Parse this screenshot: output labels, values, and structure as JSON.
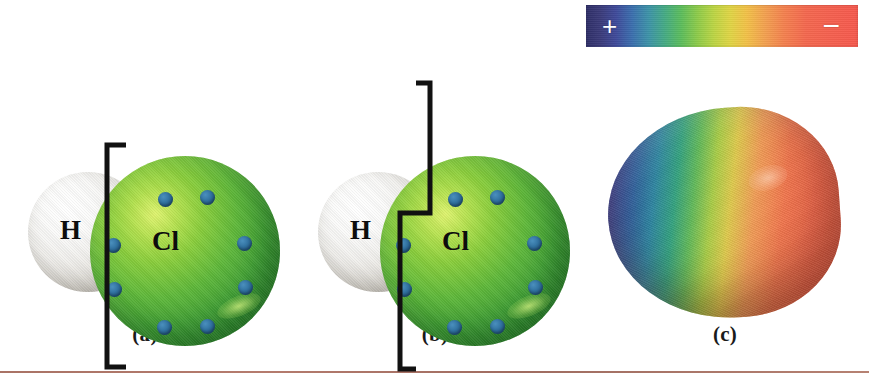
{
  "figure": {
    "width": 869,
    "height": 385
  },
  "scale_bar": {
    "name": "electrostatic-potential-scale",
    "positive_label": "+",
    "negative_label": "−",
    "stops": [
      {
        "pos": 0,
        "color": "#2f2f68",
        "name": "dark-blue"
      },
      {
        "pos": 11,
        "color": "#3f4a9a",
        "name": "blue"
      },
      {
        "pos": 23,
        "color": "#3d93a8",
        "name": "cyan"
      },
      {
        "pos": 35,
        "color": "#5cbd5c",
        "name": "green"
      },
      {
        "pos": 53,
        "color": "#e0d545",
        "name": "yellow"
      },
      {
        "pos": 72,
        "color": "#f4804f",
        "name": "orange"
      },
      {
        "pos": 100,
        "color": "#f6594e",
        "name": "red"
      }
    ]
  },
  "panels": [
    {
      "id": "a",
      "caption": "(a)",
      "atoms": [
        {
          "symbol": "H",
          "name": "hydrogen-atom",
          "color": "#e8e6e1"
        },
        {
          "symbol": "Cl",
          "name": "chlorine-atom",
          "color": "#4fae3c"
        }
      ],
      "lone_pair_dots": 8,
      "dot_color": "#2f6f9d",
      "bracket": {
        "name": "straight-bracket",
        "type": "straight"
      }
    },
    {
      "id": "b",
      "caption": "(b)",
      "atoms": [
        {
          "symbol": "H",
          "name": "hydrogen-atom",
          "color": "#e8e6e1"
        },
        {
          "symbol": "Cl",
          "name": "chlorine-atom",
          "color": "#4fae3c"
        }
      ],
      "lone_pair_dots": 8,
      "dot_color": "#2f6f9d",
      "bracket": {
        "name": "stepped-bracket",
        "type": "stepped"
      }
    },
    {
      "id": "c",
      "caption": "(c)",
      "surface": {
        "name": "electrostatic-potential-surface",
        "shape": "teardrop",
        "positive_end": "blue",
        "negative_end": "red"
      }
    }
  ],
  "dot_positions_a": [
    {
      "left": 68,
      "top": 36
    },
    {
      "left": 110,
      "top": 34
    },
    {
      "left": 16,
      "top": 82
    },
    {
      "left": 17,
      "top": 126
    },
    {
      "left": 147,
      "top": 80
    },
    {
      "left": 148,
      "top": 124
    },
    {
      "left": 67,
      "top": 164
    },
    {
      "left": 110,
      "top": 163
    }
  ],
  "dot_positions_b": [
    {
      "left": 68,
      "top": 36
    },
    {
      "left": 110,
      "top": 34
    },
    {
      "left": 16,
      "top": 82
    },
    {
      "left": 17,
      "top": 126
    },
    {
      "left": 147,
      "top": 80
    },
    {
      "left": 148,
      "top": 124
    },
    {
      "left": 67,
      "top": 164
    },
    {
      "left": 110,
      "top": 163
    }
  ]
}
